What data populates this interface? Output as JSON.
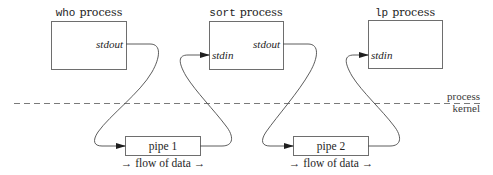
{
  "diagram": {
    "processes": [
      {
        "id": "who",
        "cmd": "who",
        "label": "process",
        "ports": {
          "out": "stdout"
        }
      },
      {
        "id": "sort",
        "cmd": "sort",
        "label": "process",
        "ports": {
          "in": "stdin",
          "out": "stdout"
        }
      },
      {
        "id": "lp",
        "cmd": "lp",
        "label": "process",
        "ports": {
          "in": "stdin"
        }
      }
    ],
    "pipes": [
      {
        "label": "pipe 1",
        "flow": "→ flow of data →"
      },
      {
        "label": "pipe 2",
        "flow": "→ flow of data →"
      }
    ],
    "boundary": {
      "upper_label": "process",
      "lower_label": "kernel"
    },
    "colors": {
      "line": "#4a4a4a",
      "box_border": "#6e6e6e",
      "text": "#1e1e1e"
    }
  }
}
